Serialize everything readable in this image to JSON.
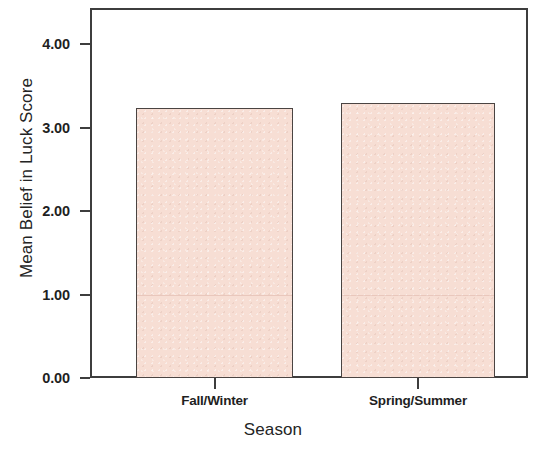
{
  "chart_data": {
    "type": "bar",
    "title": "",
    "xlabel": "Season",
    "ylabel": "Mean Belief in Luck Score",
    "categories": [
      "Fall/Winter",
      "Spring/Summer"
    ],
    "values": [
      3.23,
      3.29
    ],
    "ylim": [
      0.0,
      4.4
    ],
    "ytick_labels": [
      "0.00",
      "1.00",
      "2.00",
      "3.00",
      "4.00"
    ],
    "ytick_values": [
      0.0,
      1.0,
      2.0,
      3.0,
      4.0
    ],
    "grid": false,
    "legend": null,
    "bar_fill_color": "#f7ded4",
    "bar_edge_color": "#4a4442",
    "axis_color": "#3d3d3d",
    "background_color": "#ffffff"
  }
}
